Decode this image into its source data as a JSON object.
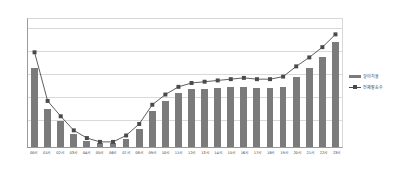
{
  "chart_data": {
    "type": "bar",
    "title": "",
    "xlabel": "",
    "ylabel": "",
    "grid": true,
    "gridline_count": 5,
    "legend_position": "right",
    "ylim": [
      0,
      100
    ],
    "categories": [
      "00시",
      "01시",
      "02시",
      "03시",
      "04시",
      "05시",
      "06시",
      "07시",
      "08시",
      "09시",
      "10시",
      "11시",
      "12시",
      "13시",
      "14시",
      "15시",
      "16시",
      "17시",
      "18시",
      "19시",
      "20시",
      "21시",
      "22시",
      "23시"
    ],
    "series": [
      {
        "name": "걸이지율",
        "type": "bar",
        "color": "#7b7b7b",
        "values": [
          62,
          30,
          20,
          10,
          5,
          3,
          3,
          6,
          14,
          28,
          36,
          42,
          45,
          45,
          46,
          47,
          47,
          46,
          46,
          47,
          55,
          62,
          70,
          82
        ]
      },
      {
        "name": "전체발송수",
        "type": "line",
        "color": "#4a4a4a",
        "marker": "square",
        "values": [
          74,
          36,
          24,
          13,
          7,
          4,
          4,
          9,
          18,
          33,
          41,
          47,
          50,
          51,
          52,
          53,
          54,
          53,
          53,
          55,
          63,
          70,
          78,
          88
        ]
      }
    ]
  },
  "legend": {
    "items": [
      {
        "label": "걸이지율",
        "key": "bar-key",
        "color": "#7b7b7b"
      },
      {
        "label": "전체발송수",
        "key": "line-marker-key",
        "color": "#4a4a4a"
      }
    ]
  }
}
